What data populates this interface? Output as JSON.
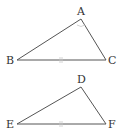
{
  "figure": {
    "triangles": [
      {
        "name": "ABC",
        "vertices": {
          "A": {
            "label": "A",
            "x": 81,
            "y": 19
          },
          "B": {
            "label": "B",
            "x": 17,
            "y": 60
          },
          "C": {
            "label": "C",
            "x": 106,
            "y": 60
          }
        },
        "side_mark": "BC double tick"
      },
      {
        "name": "DEF",
        "vertices": {
          "D": {
            "label": "D",
            "x": 81,
            "y": 87
          },
          "E": {
            "label": "E",
            "x": 17,
            "y": 124
          },
          "F": {
            "label": "F",
            "x": 106,
            "y": 124
          }
        },
        "side_mark": "EF double tick"
      }
    ]
  },
  "labels": {
    "A": "A",
    "B": "B",
    "C": "C",
    "D": "D",
    "E": "E",
    "F": "F"
  },
  "colors": {
    "line": "#555555",
    "mark": "#c8c8c8",
    "text": "#333333"
  }
}
